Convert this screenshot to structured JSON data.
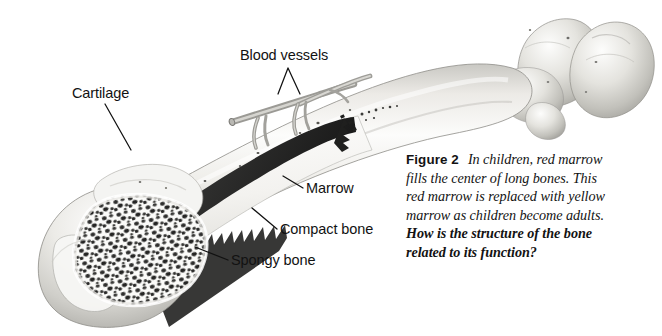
{
  "figure": {
    "kind": "anatomical-illustration",
    "background_color": "#ffffff",
    "text_color": "#121212"
  },
  "labels": [
    {
      "id": "cartilage",
      "text": "Cartilage",
      "x": 72,
      "y": 94,
      "anchor": "start"
    },
    {
      "id": "blood-vessels",
      "text": "Blood vessels",
      "x": 240,
      "y": 56,
      "anchor": "start"
    },
    {
      "id": "marrow",
      "text": "Marrow",
      "x": 305,
      "y": 190,
      "anchor": "start"
    },
    {
      "id": "compact-bone",
      "text": "Compact bone",
      "x": 279,
      "y": 231,
      "anchor": "start"
    },
    {
      "id": "spongy-bone",
      "text": "Spongy bone",
      "x": 230,
      "y": 262,
      "anchor": "start"
    }
  ],
  "caption": {
    "figure_number": "Figure 2",
    "description": "In children, red marrow fills the center of long bones. This red marrow is replaced with yellow marrow as children become adults.",
    "question": "How is the structure of the bone related to its function?"
  },
  "anatomy": {
    "marrow_color": "#2b2b2b",
    "compact_bone_color": "#f2f1ee",
    "spongy_bone_color": "#3a3a3a",
    "bone_shade_light": "#fbfbfa",
    "bone_shade_mid": "#d9d8d4",
    "bone_shade_dark": "#a8a7a2",
    "vessel_color": "#8d8d88"
  }
}
